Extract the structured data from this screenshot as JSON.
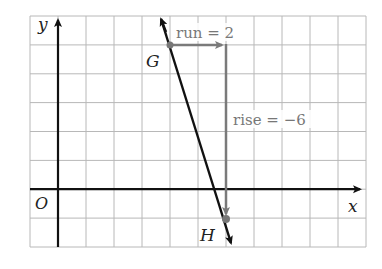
{
  "diagram": {
    "type": "coordinate-plane-slope",
    "axes": {
      "x_label": "x",
      "y_label": "y",
      "origin_label": "O"
    },
    "grid": {
      "columns": 12,
      "rows": 8,
      "line_color": "#b8b8b8",
      "border_color": "#a0a0a0"
    },
    "points": [
      {
        "name": "G",
        "label": "G",
        "grid_x": 4,
        "grid_y": 5
      },
      {
        "name": "H",
        "label": "H",
        "grid_x": 6,
        "grid_y": -1
      }
    ],
    "annotations": {
      "run_label": "run = 2",
      "rise_label": "rise = −6"
    },
    "colors": {
      "axis": "#111111",
      "line": "#111111",
      "run_rise": "#7a7a7a",
      "label_gray": "#777777",
      "text": "#222222"
    }
  }
}
